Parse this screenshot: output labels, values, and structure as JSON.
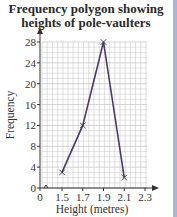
{
  "chart_data": {
    "type": "line",
    "title": "Frequency polygon showing heights of pole-vaulters",
    "title_lines": [
      "Frequency polygon showing",
      "heights of pole-vaulters"
    ],
    "xlabel": "Height (metres)",
    "ylabel": "Frequency",
    "x_ticks": [
      "0",
      "1.5",
      "1.7",
      "1.9",
      "2.1",
      "2.3"
    ],
    "y_ticks": [
      "0",
      "4",
      "8",
      "12",
      "16",
      "20",
      "24",
      "28"
    ],
    "ylim": [
      0,
      28
    ],
    "xlim": [
      1.3,
      2.3
    ],
    "grid": true,
    "axis_break": true,
    "series": [
      {
        "name": "Frequency",
        "x": [
          1.5,
          1.7,
          1.9,
          2.1
        ],
        "values": [
          3,
          12,
          28,
          2
        ],
        "marker": "x",
        "color": "#4a3a6a"
      }
    ],
    "colors": {
      "line": "#4a3a6a",
      "grid": "#c8c8c8",
      "axis": "#333333",
      "edge_bar": "#a9b5d3"
    }
  }
}
